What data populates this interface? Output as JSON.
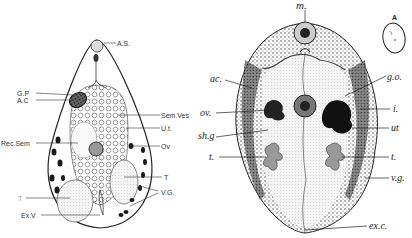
{
  "figure_left": {
    "labels": [
      {
        "id": "as",
        "text": "A.S.",
        "x": 117,
        "y": 36
      },
      {
        "id": "gp",
        "text": "G.P",
        "x": 17,
        "y": 90
      },
      {
        "id": "ac",
        "text": "A.C",
        "x": 17,
        "y": 97
      },
      {
        "id": "semves",
        "text": "Sem.Ves",
        "x": 161,
        "y": 111
      },
      {
        "id": "ut",
        "text": "U.t.",
        "x": 161,
        "y": 125
      },
      {
        "id": "recsem",
        "text": "Rec.Sem",
        "x": 1,
        "y": 140
      },
      {
        "id": "ov",
        "text": "Ov",
        "x": 161,
        "y": 143
      },
      {
        "id": "t_right",
        "text": "T",
        "x": 164,
        "y": 174
      },
      {
        "id": "vg",
        "text": "V.G.",
        "x": 161,
        "y": 189
      },
      {
        "id": "t_left",
        "text": "T",
        "x": 18,
        "y": 195
      },
      {
        "id": "exv",
        "text": "Ex.V",
        "x": 21,
        "y": 212
      }
    ]
  },
  "figure_right": {
    "labels": [
      {
        "id": "m",
        "text": "m.",
        "x": 294,
        "y": 3
      },
      {
        "id": "ac",
        "text": "ac.",
        "x": 210,
        "y": 74
      },
      {
        "id": "go",
        "text": "g.o.",
        "x": 388,
        "y": 73
      },
      {
        "id": "ov",
        "text": "ov.",
        "x": 200,
        "y": 110
      },
      {
        "id": "i",
        "text": "i.",
        "x": 393,
        "y": 106
      },
      {
        "id": "shg",
        "text": "sh.g",
        "x": 198,
        "y": 132
      },
      {
        "id": "ut",
        "text": "ut",
        "x": 391,
        "y": 125
      },
      {
        "id": "t_left",
        "text": "t.",
        "x": 209,
        "y": 154
      },
      {
        "id": "t_right",
        "text": "t.",
        "x": 391,
        "y": 154
      },
      {
        "id": "vg",
        "text": "v.g.",
        "x": 391,
        "y": 175
      },
      {
        "id": "exc",
        "text": "ex.c.",
        "x": 369,
        "y": 223
      }
    ]
  },
  "inset": {
    "label": "A"
  }
}
